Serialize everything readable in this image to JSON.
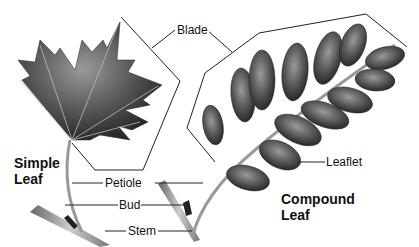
{
  "diagram": {
    "labels": {
      "blade": "Blade",
      "petiole": "Petiole",
      "bud": "Bud",
      "stem": "Stem",
      "leaflet": "Leaflet"
    },
    "titles": {
      "simple_line1": "Simple",
      "simple_line2": "Leaf",
      "compound_line1": "Compound",
      "compound_line2": "Leaf"
    },
    "colors": {
      "leaf_dark": "#3a3a3a",
      "leaf_mid": "#6a6a6a",
      "stem": "#9a9a9a",
      "line": "#222222"
    }
  }
}
